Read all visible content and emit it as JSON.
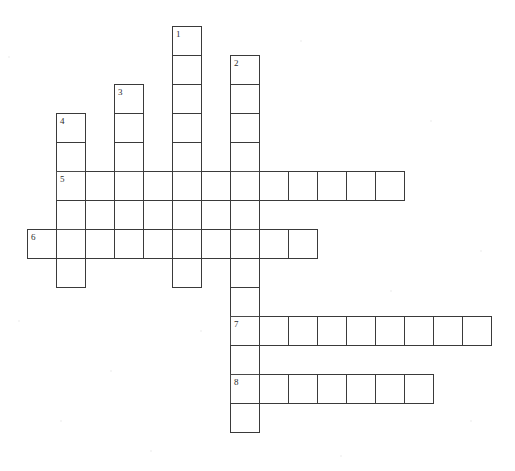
{
  "page": {
    "background_color": "#ffffff",
    "width": 515,
    "height": 471
  },
  "grid": {
    "cell_size": 29,
    "origin_x": 27,
    "origin_y": 26,
    "line_color": "#3a3a3a",
    "cell_fill": "#ffffff",
    "number_color": "#2b2b2b",
    "columns": 17,
    "rows": 15
  },
  "entries": [
    {
      "number": "1",
      "direction": "down",
      "col": 5,
      "row": 0,
      "length": 9,
      "answer": ""
    },
    {
      "number": "2",
      "direction": "down",
      "col": 7,
      "row": 1,
      "length": 13,
      "answer": ""
    },
    {
      "number": "3",
      "direction": "down",
      "col": 3,
      "row": 2,
      "length": 5,
      "answer": ""
    },
    {
      "number": "4",
      "direction": "down",
      "col": 1,
      "row": 3,
      "length": 6,
      "answer": ""
    },
    {
      "number": "5",
      "direction": "across",
      "col": 1,
      "row": 5,
      "length": 12,
      "answer": ""
    },
    {
      "number": "6",
      "direction": "across",
      "col": 0,
      "row": 7,
      "length": 10,
      "answer": ""
    },
    {
      "number": "7",
      "direction": "across",
      "col": 7,
      "row": 10,
      "length": 9,
      "answer": ""
    },
    {
      "number": "8",
      "direction": "across",
      "col": 7,
      "row": 12,
      "length": 7,
      "answer": ""
    }
  ],
  "numbers": [
    {
      "label": "1",
      "col": 5,
      "row": 0
    },
    {
      "label": "2",
      "col": 7,
      "row": 1
    },
    {
      "label": "3",
      "col": 3,
      "row": 2
    },
    {
      "label": "4",
      "col": 1,
      "row": 3
    },
    {
      "label": "5",
      "col": 1,
      "row": 5
    },
    {
      "label": "6",
      "col": 0,
      "row": 7
    },
    {
      "label": "7",
      "col": 7,
      "row": 10
    },
    {
      "label": "8",
      "col": 7,
      "row": 12
    }
  ],
  "specks": [
    {
      "x": 8,
      "y": 56,
      "r": 2
    },
    {
      "x": 300,
      "y": 40,
      "r": 2
    },
    {
      "x": 430,
      "y": 120,
      "r": 2
    },
    {
      "x": 480,
      "y": 250,
      "r": 2
    },
    {
      "x": 60,
      "y": 420,
      "r": 2
    },
    {
      "x": 150,
      "y": 450,
      "r": 2
    },
    {
      "x": 340,
      "y": 455,
      "r": 2
    },
    {
      "x": 18,
      "y": 320,
      "r": 2
    },
    {
      "x": 200,
      "y": 330,
      "r": 2
    },
    {
      "x": 390,
      "y": 290,
      "r": 2
    },
    {
      "x": 110,
      "y": 370,
      "r": 2
    },
    {
      "x": 470,
      "y": 420,
      "r": 2
    }
  ]
}
